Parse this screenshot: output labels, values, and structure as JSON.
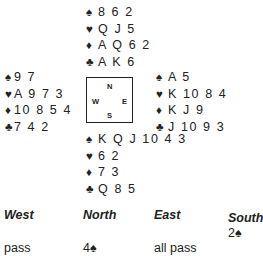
{
  "hands": {
    "north": {
      "spades": "8 6 2",
      "hearts": "Q J 5",
      "diamonds": "A Q 6 2",
      "clubs": "A K 6"
    },
    "west": {
      "spades": "9 7",
      "hearts": "A 9 7 3",
      "diamonds": "10 8 5 4",
      "clubs": "7 4 2"
    },
    "east": {
      "spades": "A 5",
      "hearts": "K 10 8 4",
      "diamonds": "K J 9",
      "clubs": "J 10 9 3"
    },
    "south": {
      "spades": "K Q J 10 4 3",
      "hearts": "6 2",
      "diamonds": "7 3",
      "clubs": "Q 8 5"
    }
  },
  "suit_symbols": {
    "spades": "♠",
    "hearts": "♥",
    "diamonds": "♦",
    "clubs": "♣"
  },
  "compass": {
    "n": "N",
    "w": "W",
    "e": "E",
    "s": "S"
  },
  "bidding": {
    "headers": [
      "West",
      "North",
      "East",
      "South"
    ],
    "round1": {
      "south": "2♠"
    },
    "round2": {
      "west": "pass",
      "north": "4♠",
      "east": "all pass"
    }
  }
}
